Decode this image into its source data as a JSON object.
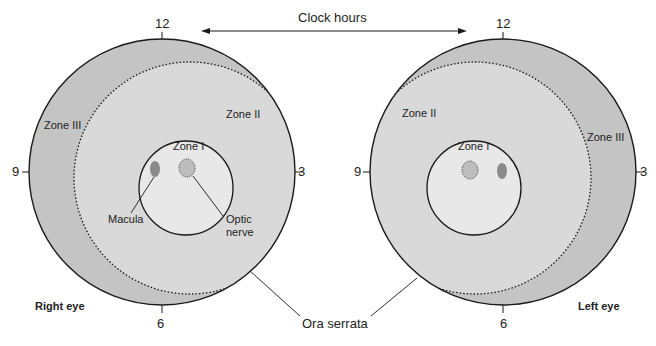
{
  "diagram": {
    "header_label": "Clock hours",
    "bottom_label": "Ora serrata",
    "colors": {
      "zone3": "#c4c4c4",
      "zone2": "#d9d9d9",
      "zone1": "#e8e8e8",
      "macula": "#8a8a8a",
      "optic_nerve": "#bdbdbd",
      "line": "#1a1a1a"
    },
    "right_eye": {
      "title": "Right eye",
      "clock": {
        "top": "12",
        "bottom": "6",
        "left": "9",
        "right": "3"
      },
      "zones": {
        "zone1": "Zone I",
        "zone2": "Zone II",
        "zone3": "Zone III"
      },
      "macula_label": "Macula",
      "optic_label_1": "Optic",
      "optic_label_2": "nerve"
    },
    "left_eye": {
      "title": "Left eye",
      "clock": {
        "top": "12",
        "bottom": "6",
        "left": "9",
        "right": "3"
      },
      "zones": {
        "zone1": "Zone I",
        "zone2": "Zone II",
        "zone3": "Zone III"
      }
    }
  }
}
